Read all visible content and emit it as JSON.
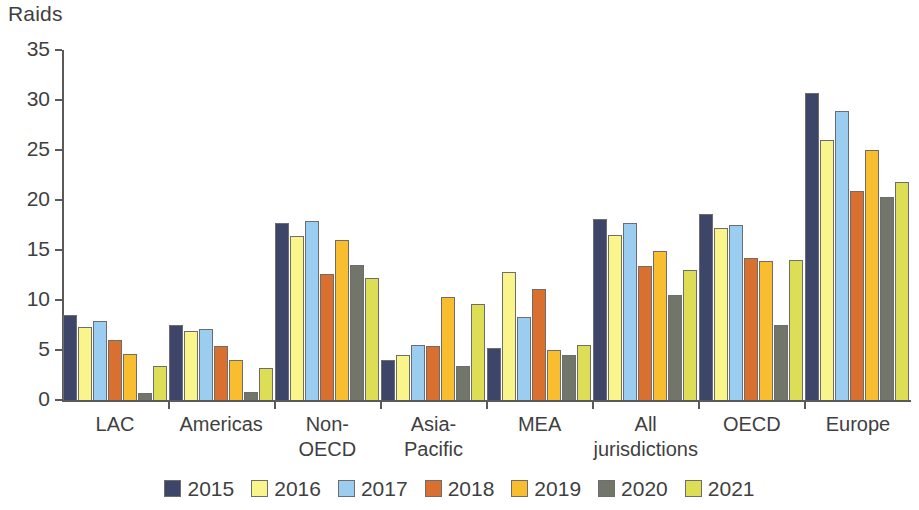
{
  "chart_data": {
    "type": "bar",
    "title": "",
    "ylabel": "Raids",
    "xlabel": "",
    "ylim": [
      0,
      35
    ],
    "yticks": [
      0,
      5,
      10,
      15,
      20,
      25,
      30,
      35
    ],
    "grid": false,
    "legend_position": "bottom",
    "categories": [
      "LAC",
      "Americas",
      "Non-\nOECD",
      "Asia-\nPacific",
      "MEA",
      "All\njurisdictions",
      "OECD",
      "Europe"
    ],
    "series": [
      {
        "name": "2015",
        "color": "#3d4668",
        "values": [
          8.5,
          7.5,
          17.7,
          4.0,
          5.2,
          18.1,
          18.6,
          30.7
        ]
      },
      {
        "name": "2016",
        "color": "#f9f58b",
        "values": [
          7.3,
          6.9,
          16.4,
          4.5,
          12.8,
          16.5,
          17.2,
          26.0
        ]
      },
      {
        "name": "2017",
        "color": "#9bcdf0",
        "values": [
          7.9,
          7.1,
          17.9,
          5.5,
          8.3,
          17.7,
          17.5,
          28.9
        ]
      },
      {
        "name": "2018",
        "color": "#d9702f",
        "values": [
          6.0,
          5.4,
          12.6,
          5.4,
          11.1,
          13.4,
          14.2,
          20.9
        ]
      },
      {
        "name": "2019",
        "color": "#f9bd30",
        "values": [
          4.6,
          4.0,
          16.0,
          10.3,
          5.0,
          14.9,
          13.9,
          25.0
        ]
      },
      {
        "name": "2020",
        "color": "#71756a",
        "values": [
          0.7,
          0.8,
          13.5,
          3.4,
          4.5,
          10.5,
          7.5,
          20.3
        ]
      },
      {
        "name": "2021",
        "color": "#ddde55",
        "values": [
          3.4,
          3.2,
          12.2,
          9.6,
          5.5,
          13.0,
          14.0,
          21.8
        ]
      }
    ],
    "axis_color": "#5a5a5a",
    "bar_outline_color": "#6d6d6d",
    "text_color": "#3f3f3f",
    "background": "#ffffff"
  }
}
